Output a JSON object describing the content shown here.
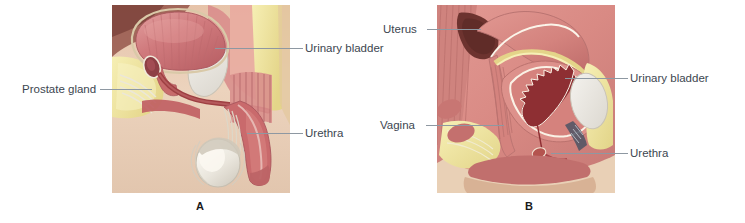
{
  "figure": {
    "panels": [
      {
        "id": "A",
        "caption": "A",
        "alt": "Sagittal section of the male pelvis showing urinary bladder, prostate gland and urethra",
        "labels": [
          {
            "name": "prostate-gland",
            "text": "Prostate gland",
            "side": "left"
          },
          {
            "name": "urinary-bladder",
            "text": "Urinary bladder",
            "side": "right"
          },
          {
            "name": "urethra",
            "text": "Urethra",
            "side": "right"
          }
        ]
      },
      {
        "id": "B",
        "caption": "B",
        "alt": "Sagittal section of the female pelvis showing uterus, vagina, urinary bladder and urethra",
        "labels": [
          {
            "name": "uterus",
            "text": "Uterus",
            "side": "left"
          },
          {
            "name": "vagina",
            "text": "Vagina",
            "side": "left"
          },
          {
            "name": "urinary-bladder",
            "text": "Urinary bladder",
            "side": "right"
          },
          {
            "name": "urethra",
            "text": "Urethra",
            "side": "right"
          }
        ]
      }
    ],
    "colors": {
      "label_text": "#3c4650",
      "leader_line": "#8e98a2",
      "caption_text": "#1a1a1a",
      "background": "#ffffff",
      "muscle_pink": "#d97f80",
      "muscle_deep": "#b8555a",
      "bladder_wall": "#c96a6c",
      "fat_yellow": "#efe39a",
      "bone_white": "#e8e6e0",
      "skin": "#e8cdb6",
      "serosa_line": "#f4efe2"
    }
  }
}
